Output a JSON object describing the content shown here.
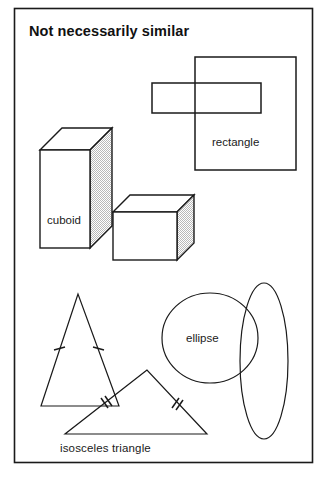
{
  "figure": {
    "title": "Not necessarily similar",
    "border_color": "#1a1a1a",
    "background_color": "#ffffff",
    "stroke_color": "#1a1a1a",
    "shade_color": "#d8d8d8"
  },
  "labels": {
    "rectangle": "rectangle",
    "cuboid": "cuboid",
    "ellipse": "ellipse",
    "isosceles_triangle": "isosceles  triangle"
  },
  "groups": [
    {
      "name": "rectangles",
      "label": "rectangle",
      "shapes": [
        {
          "kind": "rectangle",
          "x": 195,
          "y": 57,
          "width": 101,
          "height": 113
        },
        {
          "kind": "rectangle",
          "x": 152,
          "y": 83,
          "width": 109,
          "height": 30
        }
      ]
    },
    {
      "name": "cuboids",
      "label": "cuboid",
      "shapes": [
        {
          "kind": "cuboid",
          "front_x": 40,
          "front_y": 150,
          "front_width": 50,
          "front_height": 98,
          "depth_x": 22,
          "depth_y": -22
        },
        {
          "kind": "cuboid",
          "front_x": 113,
          "front_y": 212,
          "front_width": 64,
          "front_height": 48,
          "depth_x": 17,
          "depth_y": -17
        }
      ]
    },
    {
      "name": "triangles",
      "label": "isosceles  triangle",
      "shapes": [
        {
          "kind": "triangle",
          "apex_x": 78,
          "apex_y": 294,
          "left_x": 41,
          "left_y": 406,
          "right_x": 119,
          "right_y": 406,
          "ticks": 1
        },
        {
          "kind": "triangle",
          "apex_x": 147,
          "apex_y": 370,
          "left_x": 65,
          "left_y": 434,
          "right_x": 207,
          "right_y": 434,
          "ticks": 2
        }
      ]
    },
    {
      "name": "ellipses",
      "label": "ellipse",
      "shapes": [
        {
          "kind": "ellipse",
          "cx": 210,
          "cy": 338,
          "rx": 48,
          "ry": 45
        },
        {
          "kind": "ellipse",
          "cx": 264,
          "cy": 361,
          "rx": 24,
          "ry": 78
        }
      ]
    }
  ]
}
